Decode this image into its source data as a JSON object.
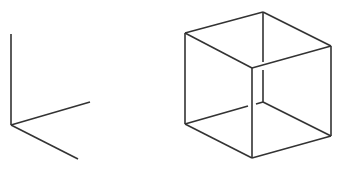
{
  "diagram": {
    "title": "",
    "figures": [
      {
        "name": "coordinate-axes",
        "description": "Three axes meeting at an origin"
      },
      {
        "name": "wireframe-cube",
        "description": "Impossible (Necker-style) wireframe cube with crossing gaps"
      }
    ],
    "line_color": "#333333",
    "background_color": "#ffffff"
  }
}
